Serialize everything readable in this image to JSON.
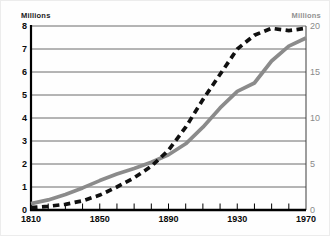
{
  "chart_data": {
    "type": "line",
    "title": "",
    "x": [
      1810,
      1820,
      1830,
      1840,
      1850,
      1860,
      1870,
      1880,
      1890,
      1900,
      1910,
      1920,
      1930,
      1940,
      1950,
      1960,
      1970
    ],
    "series": [
      {
        "name": "solid-gray-line",
        "axis": "right",
        "color": "#8b8b8b",
        "style": "solid",
        "values": [
          0.7,
          1.1,
          1.7,
          2.4,
          3.2,
          3.9,
          4.5,
          5.2,
          6.0,
          7.2,
          9.0,
          11.1,
          12.9,
          13.8,
          16.2,
          17.8,
          18.7
        ]
      },
      {
        "name": "dashed-black-line",
        "axis": "left",
        "color": "#101010",
        "style": "dashed",
        "values": [
          0.1,
          0.16,
          0.25,
          0.4,
          0.65,
          1.0,
          1.4,
          1.9,
          2.6,
          3.6,
          4.8,
          5.9,
          7.0,
          7.6,
          7.9,
          7.8,
          7.9
        ]
      }
    ],
    "left_axis": {
      "label": "Millions",
      "min": 0,
      "max": 8,
      "ticks": [
        0,
        1,
        2,
        3,
        4,
        5,
        6,
        7,
        8
      ]
    },
    "right_axis": {
      "label": "Millions",
      "min": 0,
      "max": 20,
      "ticks": [
        0,
        5,
        10,
        15,
        20
      ]
    },
    "x_axis": {
      "min": 1810,
      "max": 1970,
      "labeled_ticks": [
        1810,
        1850,
        1890,
        1930,
        1970
      ],
      "minor_tick_interval": 10
    },
    "grid": "horizontal",
    "legend": "none"
  }
}
